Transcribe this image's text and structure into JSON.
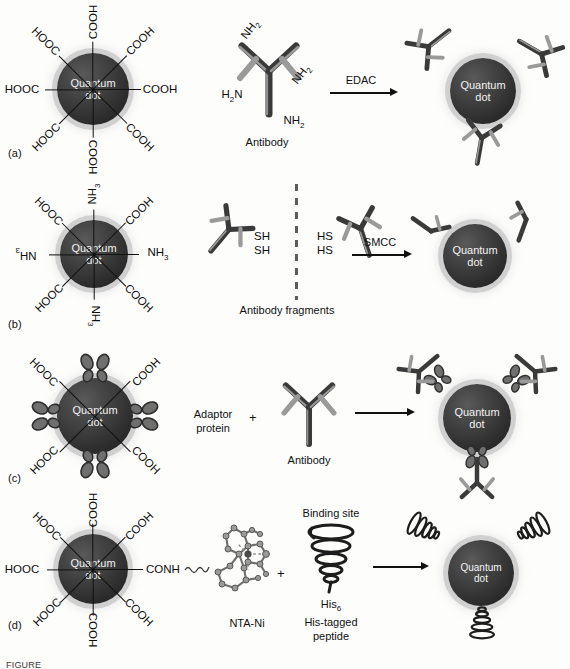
{
  "figure": {
    "background_color": "#fdfdfc",
    "quantum_dot_label_line1": "Quantum",
    "quantum_dot_label_line2": "dot",
    "quantum_dot_color": "#2f2f2f",
    "quantum_dot_halo_color": "#cdcdcd",
    "ink_color": "#111111",
    "caption": "FIGURE"
  },
  "rows": [
    {
      "id": "a",
      "panel_label": "(a)",
      "reactant_dot": {
        "label_line1": "Quantum",
        "label_line2": "dot",
        "ligands": [
          {
            "text": "COOH",
            "angle": 270
          },
          {
            "text": "COOH",
            "angle": 315
          },
          {
            "text": "COOH",
            "angle": 0
          },
          {
            "text": "COOH",
            "angle": 45
          },
          {
            "text": "COOH",
            "angle": 90
          },
          {
            "text": "HOOC",
            "angle": 135
          },
          {
            "text": "HOOC",
            "angle": 180
          },
          {
            "text": "HOOC",
            "angle": 225
          }
        ]
      },
      "reagent": {
        "name": "Antibody",
        "amine_labels": [
          "NH2",
          "NH2",
          "H2N",
          "NH2"
        ]
      },
      "arrow_label": "EDAC",
      "product_caption": "",
      "product_attachments": 3
    },
    {
      "id": "b",
      "panel_label": "(b)",
      "reactant_dot": {
        "label_line1": "Quantum",
        "label_line2": "dot",
        "ligands": [
          {
            "text": "NH3",
            "angle": 270
          },
          {
            "text": "COOH",
            "angle": 315
          },
          {
            "text": "NH3",
            "angle": 0
          },
          {
            "text": "COOH",
            "angle": 45
          },
          {
            "text": "NH3",
            "angle": 90
          },
          {
            "text": "HOOC",
            "angle": 135
          },
          {
            "text": "NH3",
            "angle": 180
          },
          {
            "text": "HOOC",
            "angle": 225
          }
        ]
      },
      "reagent": {
        "name": "Antibody fragments",
        "thiol_labels_left": [
          "SH",
          "SH"
        ],
        "thiol_labels_right": [
          "HS",
          "HS"
        ]
      },
      "arrow_label": "SMCC",
      "product_attachments": 2
    },
    {
      "id": "c",
      "panel_label": "(c)",
      "reactant_dot": {
        "label_line1": "Quantum",
        "label_line2": "dot",
        "ligands": [
          {
            "text": "COOH",
            "angle": 315
          },
          {
            "text": "COOH",
            "angle": 45
          },
          {
            "text": "HOOC",
            "angle": 135
          },
          {
            "text": "HOOC",
            "angle": 225
          }
        ],
        "adaptor_count": 4
      },
      "adaptor_caption_line1": "Adaptor",
      "adaptor_caption_line2": "protein",
      "plus": "+",
      "reagent": {
        "name": "Antibody"
      },
      "arrow_label": "",
      "product_attachments": 3
    },
    {
      "id": "d",
      "panel_label": "(d)",
      "reactant_dot": {
        "label_line1": "Quantum",
        "label_line2": "dot",
        "ligands": [
          {
            "text": "COOH",
            "angle": 270
          },
          {
            "text": "COOH",
            "angle": 315
          },
          {
            "text": "CONH",
            "angle": 0
          },
          {
            "text": "COOH",
            "angle": 45
          },
          {
            "text": "COOH",
            "angle": 90
          },
          {
            "text": "HOOC",
            "angle": 135
          },
          {
            "text": "HOOC",
            "angle": 180
          },
          {
            "text": "HOOC",
            "angle": 225
          }
        ]
      },
      "nta_caption": "NTA-Ni",
      "plus": "+",
      "peptide": {
        "binding_site_label": "Binding site",
        "his_label": "His",
        "his_subscript": "6",
        "caption_line1": "His-tagged",
        "caption_line2": "peptide"
      },
      "arrow_label": "",
      "product_attachments": 3
    }
  ]
}
